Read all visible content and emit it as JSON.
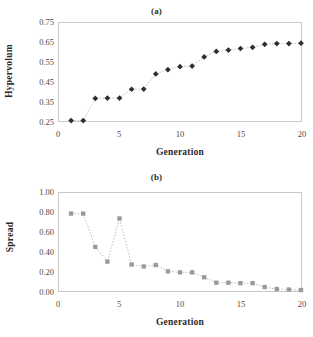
{
  "figure": {
    "width": 313,
    "height": 337
  },
  "panels": [
    {
      "id": "a",
      "title": "(a)",
      "ylabel": "Hypervolum",
      "xlabel": "Generation"
    },
    {
      "id": "b",
      "title": "(b)",
      "ylabel": "Spread",
      "xlabel": "Generation"
    }
  ],
  "chart_data": [
    {
      "type": "scatter",
      "title": "(a)",
      "xlabel": "Generation",
      "ylabel": "Hypervolum",
      "xlim": [
        0,
        20
      ],
      "ylim": [
        0.25,
        0.75
      ],
      "xticks": [
        0,
        5,
        10,
        15,
        20
      ],
      "yticks": [
        0.25,
        0.35,
        0.45,
        0.55,
        0.65,
        0.75
      ],
      "ytick_labels": [
        "0.25",
        "0.35",
        "0.45",
        "0.55",
        "0.65",
        "0.75"
      ],
      "xtick_labels": [
        "0",
        "5",
        "10",
        "15",
        "20"
      ],
      "grid": false,
      "legend": "none",
      "marker": "diamond",
      "marker_color": "#2f2f2f",
      "line_style": "dotted",
      "line_color": "#b0b0b0",
      "x": [
        1,
        2,
        3,
        4,
        5,
        6,
        7,
        8,
        9,
        10,
        11,
        12,
        13,
        14,
        15,
        16,
        17,
        18,
        19,
        20
      ],
      "values": [
        0.252,
        0.252,
        0.365,
        0.367,
        0.367,
        0.412,
        0.413,
        0.49,
        0.512,
        0.527,
        0.53,
        0.577,
        0.605,
        0.612,
        0.62,
        0.626,
        0.641,
        0.645,
        0.645,
        0.647
      ]
    },
    {
      "type": "scatter",
      "title": "(b)",
      "xlabel": "Generation",
      "ylabel": "Spread",
      "xlim": [
        0,
        20
      ],
      "ylim": [
        0.0,
        1.0
      ],
      "xticks": [
        0,
        5,
        10,
        15,
        20
      ],
      "yticks": [
        0.0,
        0.2,
        0.4,
        0.6,
        0.8,
        1.0
      ],
      "ytick_labels": [
        "0.00",
        "0.20",
        "0.40",
        "0.60",
        "0.80",
        "1.00"
      ],
      "xtick_labels": [
        "0",
        "5",
        "10",
        "15",
        "20"
      ],
      "grid": false,
      "legend": "none",
      "marker": "square",
      "marker_color": "#9a9a9a",
      "line_style": "dotted",
      "line_color": "#b8b8b8",
      "x": [
        1,
        2,
        3,
        4,
        5,
        6,
        7,
        8,
        9,
        10,
        11,
        12,
        13,
        14,
        15,
        16,
        17,
        18,
        19,
        20
      ],
      "values": [
        0.79,
        0.79,
        0.45,
        0.3,
        0.74,
        0.27,
        0.25,
        0.265,
        0.2,
        0.19,
        0.19,
        0.14,
        0.085,
        0.085,
        0.08,
        0.08,
        0.04,
        0.02,
        0.015,
        0.01
      ]
    }
  ]
}
